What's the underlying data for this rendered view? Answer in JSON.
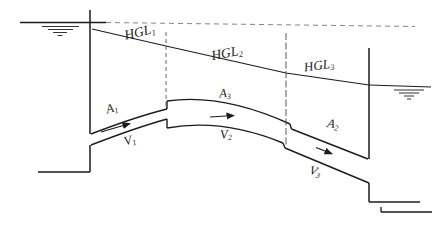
{
  "colors": {
    "ink": "#1c1c1c",
    "paper": "#ffffff"
  },
  "diagram": {
    "hgl_labels": {
      "hgl1": {
        "base": "HGL",
        "sub": "1"
      },
      "hgl2": {
        "base": "HGL",
        "sub": "2"
      },
      "hgl3": {
        "base": "HGL",
        "sub": "3"
      }
    },
    "area_labels": {
      "a1": {
        "base": "A",
        "sub": "1"
      },
      "a3": {
        "base": "A",
        "sub": "3"
      },
      "a2": {
        "base": "A",
        "sub": "2"
      }
    },
    "velocity_labels": {
      "v1": {
        "base": "V",
        "sub": "1"
      },
      "v2": {
        "base": "V",
        "sub": "2"
      },
      "v3": {
        "base": "V",
        "sub": "3"
      }
    }
  }
}
